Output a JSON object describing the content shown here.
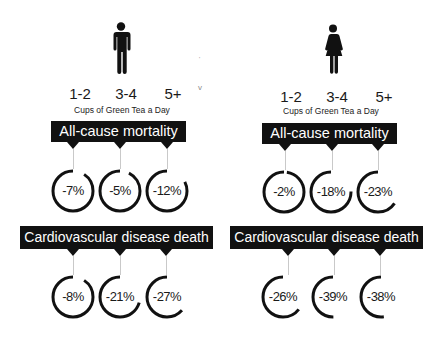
{
  "men": {
    "icon": "man-icon",
    "cups": [
      "1-2",
      "3-4",
      "5+"
    ],
    "cups_caption": "Cups of Green Tea a Day",
    "all_cause": {
      "title": "All-cause mortality",
      "values": [
        "-7%",
        "-5%",
        "-12%"
      ],
      "arc": [
        0.9,
        0.92,
        0.82
      ]
    },
    "cardio": {
      "title": "Cardiovascular disease death",
      "values": [
        "-8%",
        "-21%",
        "-27%"
      ],
      "arc": [
        0.9,
        0.7,
        0.63
      ]
    }
  },
  "women": {
    "icon": "woman-icon",
    "cups": [
      "1-2",
      "3-4",
      "5+"
    ],
    "cups_caption": "Cups of Green Tea a Day",
    "all_cause": {
      "title": "All-cause mortality",
      "values": [
        "-2%",
        "-18%",
        "-23%"
      ],
      "arc": [
        0.97,
        0.75,
        0.65
      ]
    },
    "cardio": {
      "title": "Cardiovascular disease death",
      "values": [
        "-26%",
        "-39%",
        "-38%"
      ],
      "arc": [
        0.64,
        0.5,
        0.52
      ]
    }
  },
  "colors": {
    "ink": "#111111",
    "stem": "#c9c9c9",
    "background": "#ffffff"
  }
}
